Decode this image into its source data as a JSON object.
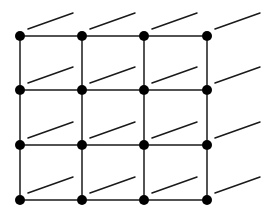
{
  "diagram": {
    "type": "lattice-grid",
    "rows": 4,
    "cols": 4,
    "col_x": [
      20,
      82,
      144,
      207
    ],
    "row_y": [
      36,
      90,
      145,
      200
    ],
    "node_radius": 5,
    "diagonal_offset": {
      "start_dx": 8,
      "start_dy": -7,
      "end_dx": 53,
      "end_dy": -23
    },
    "colors": {
      "background": "#ffffff",
      "node": "#000000",
      "edge": "#1a1a1a"
    }
  }
}
